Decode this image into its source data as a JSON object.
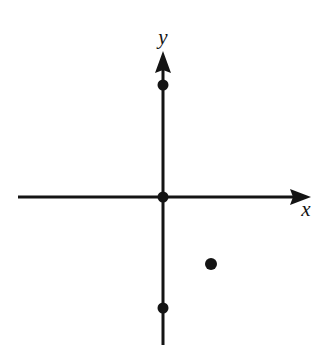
{
  "figure": {
    "width": 321,
    "height": 349,
    "background_color": "#ffffff",
    "ink_color": "#141414"
  },
  "axes": {
    "x_axis": {
      "label": "x",
      "label_position": {
        "x": 306,
        "y": 216
      },
      "line": {
        "x1": 18,
        "y1": 197,
        "x2": 297,
        "y2": 197
      },
      "stroke_width": 3,
      "arrow": {
        "direction": "right",
        "tip_x": 311,
        "tip_y": 197
      }
    },
    "y_axis": {
      "label": "y",
      "label_position": {
        "x": 163,
        "y": 44
      },
      "line": {
        "x1": 163,
        "y1": 345,
        "x2": 163,
        "y2": 65
      },
      "stroke_width": 3,
      "arrow": {
        "direction": "up",
        "tip_x": 163,
        "tip_y": 51
      }
    },
    "origin": {
      "x": 163,
      "y": 197
    }
  },
  "chart_data": {
    "type": "scatter",
    "title": "",
    "xlabel": "x",
    "ylabel": "y",
    "grid": false,
    "legend": "none",
    "axis_style": "arrows-both-ends",
    "points": [
      {
        "name": "point-on-positive-y-axis",
        "px": 163,
        "py": 85,
        "radius": 5.5,
        "color": "#141414",
        "quadrant": "positive-y-axis"
      },
      {
        "name": "point-at-origin",
        "px": 163,
        "py": 197,
        "radius": 5.5,
        "color": "#141414",
        "quadrant": "origin"
      },
      {
        "name": "point-in-quadrant-four",
        "px": 211,
        "py": 264,
        "radius": 6.0,
        "color": "#141414",
        "quadrant": "IV"
      },
      {
        "name": "point-on-negative-y-axis",
        "px": 163,
        "py": 308,
        "radius": 5.5,
        "color": "#141414",
        "quadrant": "negative-y-axis"
      }
    ]
  }
}
